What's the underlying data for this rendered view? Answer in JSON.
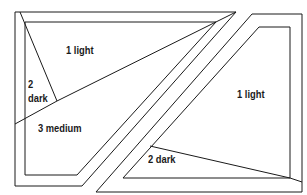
{
  "diagram": {
    "type": "quilt-block-layout",
    "labels": {
      "left_top_light": "1 light",
      "left_dark_line1": "2",
      "left_dark_line2": "dark",
      "left_medium": "3 medium",
      "right_light": "1 light",
      "right_dark": "2 dark"
    },
    "colors": {
      "line": "#1a1a1a",
      "background": "#ffffff"
    }
  }
}
